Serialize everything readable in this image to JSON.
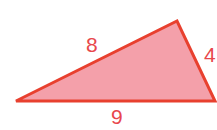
{
  "diagram": {
    "type": "triangle",
    "fill_color": "#f4a0aa",
    "stroke_color": "#e8402f",
    "label_color": "#e8474c",
    "vertices": [
      [
        16,
        101
      ],
      [
        177,
        21
      ],
      [
        215,
        101
      ]
    ],
    "sides": {
      "left_upper": "8",
      "right": "4",
      "bottom": "9"
    }
  }
}
